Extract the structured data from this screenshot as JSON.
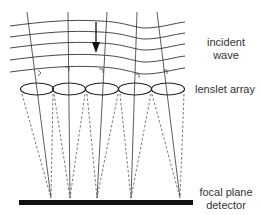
{
  "labels": {
    "incident_wave_line1": "incident",
    "incident_wave_line2": "wave",
    "lenslet_array": "lenslet array",
    "focal_plane_line1": "focal plane",
    "focal_plane_line2": "detector"
  },
  "diagram": {
    "type": "Shack-Hartmann wavefront sensor schematic",
    "lenslet_count": 5,
    "wavefront_count": 5,
    "colors": {
      "line": "#333333",
      "detector": "#111111",
      "arrow": "#111111",
      "dashed": "#555555"
    }
  }
}
